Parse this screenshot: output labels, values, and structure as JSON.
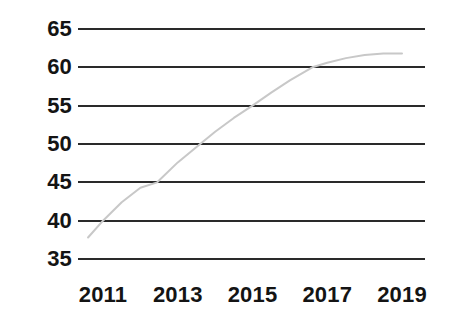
{
  "chart_data": {
    "type": "line",
    "title": "",
    "subtitle": "",
    "xlabel": "",
    "ylabel": "",
    "xlim": [
      2010.6,
      2019.3
    ],
    "ylim": [
      35,
      65
    ],
    "grid": "horizontal-only",
    "legend": "none",
    "y_ticks": [
      65,
      60,
      55,
      50,
      45,
      40,
      35
    ],
    "x_ticks": [
      2011,
      2013,
      2015,
      2017,
      2019
    ],
    "x_tick_labels": [
      "2011",
      "2013",
      "2015",
      "2017",
      "2019"
    ],
    "y_tick_labels": [
      "65",
      "60",
      "55",
      "50",
      "45",
      "40",
      "35"
    ],
    "series": [
      {
        "name": "series-1",
        "color": "#c8c8c8",
        "line_width": 2,
        "markers": "none",
        "x": [
          2010.6,
          2011.0,
          2011.5,
          2012.0,
          2012.45,
          2013.0,
          2013.6,
          2014.0,
          2014.5,
          2015.0,
          2015.5,
          2016.0,
          2016.6,
          2017.0,
          2017.5,
          2018.0,
          2018.5,
          2019.0
        ],
        "values": [
          37.8,
          40.0,
          42.4,
          44.3,
          45.0,
          47.6,
          50.0,
          51.6,
          53.4,
          55.0,
          56.7,
          58.3,
          60.0,
          60.6,
          61.2,
          61.6,
          61.8,
          61.8
        ]
      }
    ],
    "annotations": []
  },
  "style": {
    "background": "#ffffff",
    "gridline_color": "#2a2a2a",
    "gridline_width": 2,
    "tick_label_color": "#141414",
    "series_color": "#c8c8c8"
  }
}
